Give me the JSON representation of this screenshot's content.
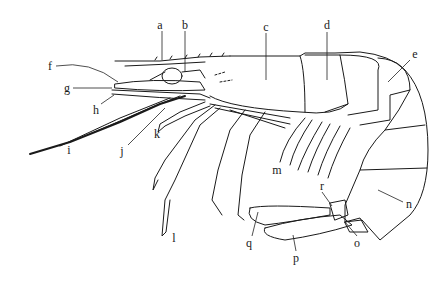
{
  "diagram": {
    "line_color": "#1a1a1a",
    "background": "#ffffff",
    "labels": [
      {
        "id": "a",
        "text": "a",
        "x": 160,
        "y": 25
      },
      {
        "id": "b",
        "text": "b",
        "x": 185,
        "y": 25
      },
      {
        "id": "c",
        "text": "c",
        "x": 266,
        "y": 27
      },
      {
        "id": "d",
        "text": "d",
        "x": 327,
        "y": 25
      },
      {
        "id": "e",
        "text": "e",
        "x": 415,
        "y": 54
      },
      {
        "id": "f",
        "text": "f",
        "x": 50,
        "y": 66
      },
      {
        "id": "g",
        "text": "g",
        "x": 67,
        "y": 88
      },
      {
        "id": "h",
        "text": "h",
        "x": 96,
        "y": 110
      },
      {
        "id": "i",
        "text": "i",
        "x": 69,
        "y": 150
      },
      {
        "id": "j",
        "text": "j",
        "x": 122,
        "y": 151
      },
      {
        "id": "k",
        "text": "k",
        "x": 157,
        "y": 134
      },
      {
        "id": "l",
        "text": "l",
        "x": 174,
        "y": 238
      },
      {
        "id": "m",
        "text": "m",
        "x": 277,
        "y": 170
      },
      {
        "id": "n",
        "text": "n",
        "x": 409,
        "y": 204
      },
      {
        "id": "o",
        "text": "o",
        "x": 357,
        "y": 243
      },
      {
        "id": "p",
        "text": "p",
        "x": 296,
        "y": 258
      },
      {
        "id": "q",
        "text": "q",
        "x": 249,
        "y": 243
      },
      {
        "id": "r",
        "text": "r",
        "x": 322,
        "y": 186
      }
    ]
  }
}
